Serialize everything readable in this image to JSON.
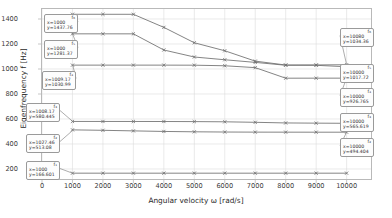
{
  "chart_data": {
    "type": "line",
    "title": "",
    "xlabel": "Angular velocity ω [rad/s]",
    "ylabel": "Eigenfrequency f [Hz]",
    "xlim": [
      0,
      10800
    ],
    "ylim": [
      120,
      1480
    ],
    "xticks": [
      0,
      1000,
      2000,
      3000,
      4000,
      5000,
      6000,
      7000,
      8000,
      9000,
      10000
    ],
    "yticks": [
      200,
      400,
      600,
      800,
      1000,
      1200,
      1400
    ],
    "grid": true,
    "legend": "none",
    "marker": "x",
    "x": [
      1000,
      2000,
      3000,
      4000,
      5000,
      6000,
      7000,
      8000,
      9000,
      10000
    ],
    "series": [
      {
        "name": "f6",
        "values": [
          1437.76,
          1437.7,
          1437.6,
          1333.0,
          1210.0,
          1146.0,
          1063.0,
          1032.0,
          1032.5,
          1034.36
        ]
      },
      {
        "name": "f5",
        "values": [
          1281.37,
          1281.3,
          1281.2,
          1152.0,
          1096.0,
          1074.0,
          1053.0,
          1030.0,
          1029.5,
          1017.72
        ]
      },
      {
        "name": "f4",
        "values": [
          1030.99,
          1031.0,
          1031.0,
          1031.0,
          1030.5,
          1026.0,
          1011.0,
          926.5,
          926.6,
          926.765
        ]
      },
      {
        "name": "f3",
        "values": [
          580.445,
          580.3,
          580.2,
          579.9,
          579.2,
          577.5,
          573.5,
          568.5,
          566.8,
          565.619
        ]
      },
      {
        "name": "f2",
        "values": [
          513.08,
          509.5,
          505.0,
          500.5,
          497.5,
          495.8,
          494.9,
          494.6,
          494.5,
          494.404
        ]
      },
      {
        "name": "f1",
        "values": [
          166.601,
          166.6,
          166.6,
          166.6,
          166.6,
          166.6,
          166.6,
          166.6,
          166.6,
          166.6
        ]
      }
    ]
  },
  "annotations": {
    "left": [
      {
        "id": "f₆",
        "x_text": "x=1000",
        "y_text": "y=1437.76",
        "point_x": 1000,
        "point_y": 1437.76
      },
      {
        "id": "f₅",
        "x_text": "x=1000",
        "y_text": "y=1281.37",
        "point_x": 1000,
        "point_y": 1281.37
      },
      {
        "id": "f₄",
        "x_text": "x=1009.17",
        "y_text": "y=1030.99",
        "point_x": 1009.17,
        "point_y": 1030.99
      },
      {
        "id": "f₃",
        "x_text": "x=1008.17",
        "y_text": "y=580.445",
        "point_x": 1008.17,
        "point_y": 580.445
      },
      {
        "id": "f₂",
        "x_text": "x=1027.46",
        "y_text": "y=513.08",
        "point_x": 1027.46,
        "point_y": 513.08
      },
      {
        "id": "f₁",
        "x_text": "x=1000",
        "y_text": "y=166.601",
        "point_x": 1000,
        "point_y": 166.601
      }
    ],
    "right": [
      {
        "id": "f₆",
        "x_text": "x=10080",
        "y_text": "y=1034.36",
        "point_x": 10000,
        "point_y": 1034.36
      },
      {
        "id": "f₅",
        "x_text": "x=10000",
        "y_text": "y=1017.72",
        "point_x": 10000,
        "point_y": 1017.72
      },
      {
        "id": "f₄",
        "x_text": "x=10000",
        "y_text": "y=926.765",
        "point_x": 10000,
        "point_y": 926.765
      },
      {
        "id": "f₃",
        "x_text": "x=10000",
        "y_text": "y=565.619",
        "point_x": 10000,
        "point_y": 565.619
      },
      {
        "id": "f₂",
        "x_text": "x=10000",
        "y_text": "y=494.404",
        "point_x": 10000,
        "point_y": 494.404
      }
    ]
  },
  "style": {
    "line_color": "#6e6e6e",
    "grid_color": "#dcdcdc",
    "frame_color": "#b9b9b9",
    "text_color": "#2f2f2f",
    "background": "#ffffff"
  }
}
